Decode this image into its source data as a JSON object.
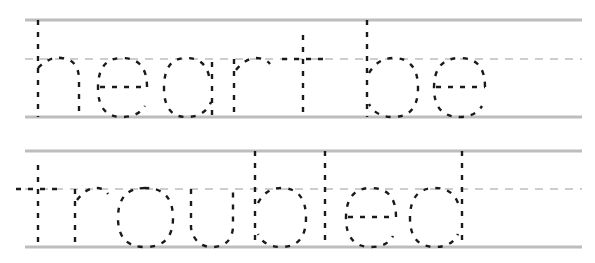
{
  "worksheet": {
    "type": "handwriting tracing practice",
    "rows": [
      {
        "text": "heart be",
        "guides": {
          "top": 20,
          "mid": 59,
          "base": 117,
          "x1": 25,
          "x2": 582
        },
        "letters": [
          {
            "char": "h",
            "paths": [
              "M38 20 L38 117",
              "M38 68 Q50 56 62 58 Q79 60 79 80 L79 117"
            ]
          },
          {
            "char": "e",
            "paths": [
              "M100 87 L147 87",
              "M147 87 Q147 58 122 58 Q98 58 98 88 Q98 117 122 117 Q138 117 145 106"
            ]
          },
          {
            "char": "a",
            "paths": [
              "M212 62 L212 117",
              "M209 76 Q205 58 186 58 Q164 58 164 88 Q164 117 186 117 Q205 117 211 102"
            ]
          },
          {
            "char": "r",
            "paths": [
              "M234 59 L234 117",
              "M236 70 Q246 58 256 58 Q265 58 270 64"
            ]
          },
          {
            "char": "t",
            "paths": [
              "M303 35 L303 117",
              "M282 59 L326 59"
            ]
          },
          {
            "char": "b",
            "paths": [
              "M367 20 L367 117",
              "M369 73 Q378 58 393 58 Q418 58 418 88 Q418 117 393 117 Q376 117 369 104"
            ]
          },
          {
            "char": "e",
            "paths": [
              "M436 87 L485 87",
              "M485 87 Q485 58 460 58 Q434 58 434 88 Q434 117 460 117 Q475 117 482 106"
            ]
          }
        ]
      },
      {
        "text": "troubled",
        "guides": {
          "top": 151,
          "mid": 189,
          "base": 247,
          "x1": 25,
          "x2": 582
        },
        "letters": [
          {
            "char": "t",
            "paths": [
              "M38 165 L38 247",
              "M16 189 L60 189"
            ]
          },
          {
            "char": "r",
            "paths": [
              "M75 189 L75 247",
              "M77 200 Q86 188 96 188 Q104 188 108 194"
            ]
          },
          {
            "char": "o",
            "paths": [
              "M145 188 Q118 188 118 218 Q118 247 145 247 Q173 247 173 218 Q173 188 145 188"
            ]
          },
          {
            "char": "u",
            "paths": [
              "M191 189 L191 228 Q195 247 212 247 Q231 247 233 228 L233 189"
            ]
          },
          {
            "char": "b",
            "paths": [
              "M255 151 L255 247",
              "M258 203 Q266 188 281 188 Q306 188 306 218 Q306 247 281 247 Q264 247 258 234"
            ]
          },
          {
            "char": "l",
            "paths": [
              "M325 151 L325 247"
            ]
          },
          {
            "char": "e",
            "paths": [
              "M348 217 L396 217",
              "M396 217 Q396 188 371 188 Q346 188 346 218 Q346 247 371 247 Q387 247 393 236"
            ]
          },
          {
            "char": "d",
            "paths": [
              "M462 151 L462 247",
              "M458 203 Q452 188 435 188 Q410 188 410 218 Q410 247 435 247 Q452 247 458 234"
            ]
          }
        ]
      }
    ]
  },
  "colors": {
    "guide_line": "#bdbdbd",
    "letter_stroke": "#1a1a1a",
    "background": "#ffffff"
  }
}
